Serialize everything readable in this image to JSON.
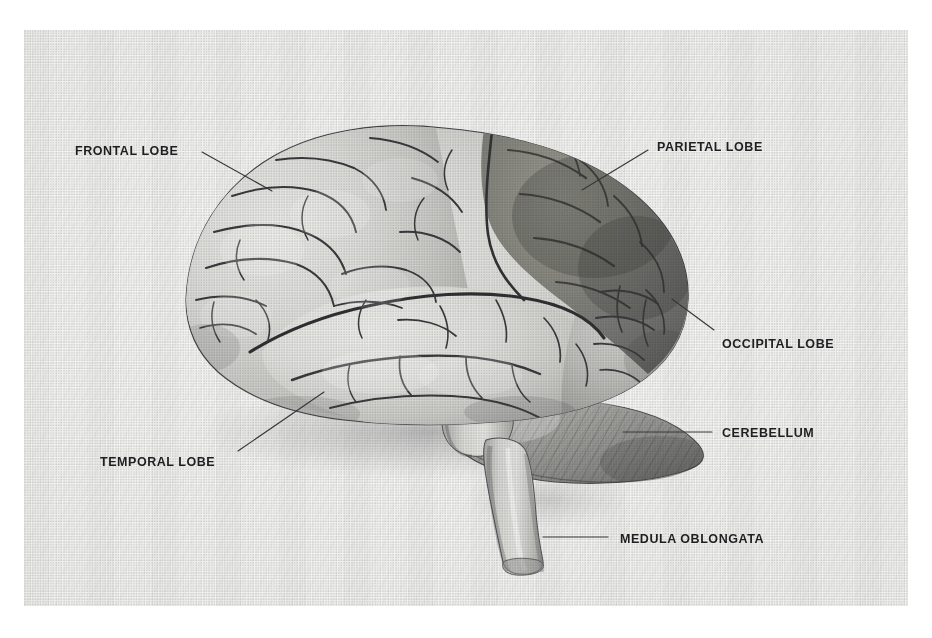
{
  "figure": {
    "style": "grayscale halftone print illustration on scanned page",
    "background_color": "#f4f4f2",
    "page_color": "#ffffff",
    "label_color": "#1f1f22",
    "leader_color": "#3a3a3e"
  },
  "labels": [
    {
      "id": "frontal-lobe",
      "text": "FRONTAL LOBE",
      "x": 75,
      "y": 145,
      "align": "left",
      "leader": {
        "x1": 202,
        "y1": 152,
        "x2": 272,
        "y2": 191,
        "style": "diagonal"
      }
    },
    {
      "id": "parietal-lobe",
      "text": "PARIETAL LOBE",
      "x": 657,
      "y": 141,
      "align": "left",
      "leader": {
        "x1": 648,
        "y1": 150,
        "x2": 582,
        "y2": 190,
        "style": "diagonal"
      }
    },
    {
      "id": "occipital-lobe",
      "text": "OCCIPITAL LOBE",
      "x": 722,
      "y": 338,
      "align": "left",
      "leader": {
        "x1": 714,
        "y1": 330,
        "x2": 672,
        "y2": 299,
        "style": "diagonal"
      }
    },
    {
      "id": "cerebellum",
      "text": "CEREBELLUM",
      "x": 722,
      "y": 427,
      "align": "left",
      "leader": {
        "x1": 712,
        "y1": 432,
        "x2": 623,
        "y2": 432,
        "style": "horizontal"
      }
    },
    {
      "id": "medulla-oblongata",
      "text": "MEDULA OBLONGATA",
      "x": 620,
      "y": 533,
      "align": "left",
      "leader": {
        "x1": 608,
        "y1": 537,
        "x2": 543,
        "y2": 537,
        "style": "horizontal"
      }
    },
    {
      "id": "temporal-lobe",
      "text": "TEMPORAL LOBE",
      "x": 100,
      "y": 456,
      "align": "left",
      "leader": {
        "x1": 238,
        "y1": 451,
        "x2": 324,
        "y2": 392,
        "style": "diagonal"
      }
    }
  ],
  "structures": [
    {
      "id": "frontal-lobe",
      "name": "Frontal lobe",
      "shading": "light gray",
      "tone": "#d9d9d6"
    },
    {
      "id": "parietal-lobe",
      "name": "Parietal lobe",
      "shading": "dark gray (highlighted)",
      "tone": "#7e7e7c"
    },
    {
      "id": "occipital-lobe",
      "name": "Occipital lobe",
      "shading": "medium gray",
      "tone": "#b4b4b1"
    },
    {
      "id": "temporal-lobe",
      "name": "Temporal lobe",
      "shading": "light gray",
      "tone": "#dcdcd9"
    },
    {
      "id": "cerebellum",
      "name": "Cerebellum",
      "shading": "medium gray with folia striations",
      "tone": "#9a9a97"
    },
    {
      "id": "medulla-oblongata",
      "name": "Medulla oblongata",
      "shading": "light gray cylinder",
      "tone": "#c9c9c6"
    }
  ]
}
